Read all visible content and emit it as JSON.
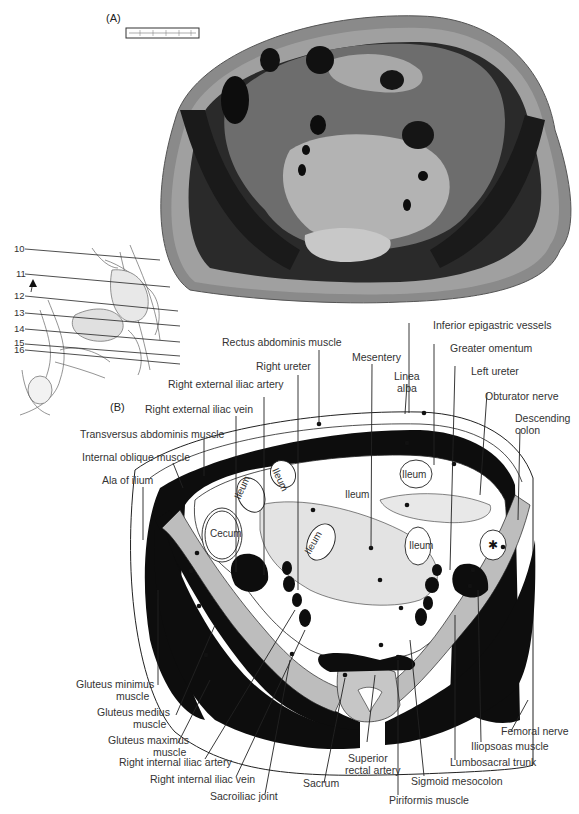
{
  "figure": {
    "panel_a_label": "(A)",
    "panel_b_label": "(B)",
    "scale_bar": "scale-bar",
    "colors": {
      "muscle": "#111111",
      "bone": "#bdbdbd",
      "fat": "#ffffff",
      "mesentery": "#e6e6e6",
      "line": "#222222",
      "text": "#333333"
    }
  },
  "inset": {
    "level_numbers": [
      "10",
      "11",
      "12",
      "13",
      "14",
      "15",
      "16"
    ],
    "current_level": "11"
  },
  "labels": {
    "rectus_abdominis": "Rectus abdominis muscle",
    "right_ureter": "Right ureter",
    "right_external_iliac_artery": "Right external iliac artery",
    "right_external_iliac_vein": "Right external iliac vein",
    "transversus_abdominis": "Transversus abdominis muscle",
    "internal_oblique": "Internal oblique muscle",
    "ala_of_ilium": "Ala of ilium",
    "inferior_epigastric": "Inferior epigastric vessels",
    "greater_omentum": "Greater omentum",
    "mesentery": "Mesentery",
    "linea_alba_1": "Linea",
    "linea_alba_2": "alba",
    "left_ureter": "Left ureter",
    "obturator_nerve": "Obturator nerve",
    "descending_colon_1": "Descending",
    "descending_colon_2": "colon",
    "gluteus_minimus_1": "Gluteus minimus",
    "gluteus_minimus_2": "muscle",
    "gluteus_medius_1": "Gluteus medius",
    "gluteus_medius_2": "muscle",
    "gluteus_maximus_1": "Gluteus maximus",
    "gluteus_maximus_2": "muscle",
    "right_internal_iliac_artery": "Right internal iliac artery",
    "right_internal_iliac_vein": "Right internal iliac vein",
    "sacroiliac_joint": "Sacroiliac joint",
    "sacrum": "Sacrum",
    "superior_rectal_1": "Superior",
    "superior_rectal_2": "rectal artery",
    "piriformis": "Piriformis muscle",
    "sigmoid_mesocolon": "Sigmoid mesocolon",
    "lumbosacral_trunk": "Lumbosacral trunk",
    "iliopsoas": "Iliopsoas muscle",
    "femoral_nerve": "Femoral nerve"
  },
  "in_image_labels": {
    "cecum": "Cecum",
    "ileum": "Ileum"
  }
}
